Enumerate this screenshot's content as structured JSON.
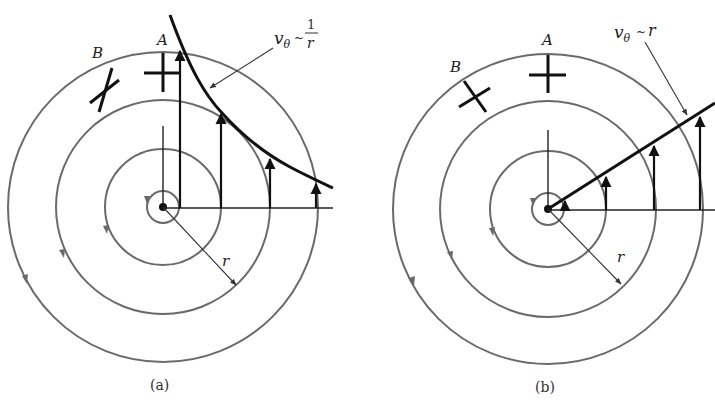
{
  "panels": [
    {
      "id": "a",
      "caption": "(a)",
      "velocity_law": {
        "main": "v",
        "sub": "θ",
        "tilde": "~",
        "num": "1",
        "den": "r"
      },
      "labels": {
        "A": "A",
        "B": "B",
        "radius": "r"
      },
      "description": "Irrotational (free) vortex: tangential velocity decreases as 1/r; fluid element B deforms but does not rotate"
    },
    {
      "id": "b",
      "caption": "(b)",
      "velocity_law": {
        "main": "v",
        "sub": "θ",
        "tilde": "~",
        "rhs": "r"
      },
      "labels": {
        "A": "A",
        "B": "B",
        "radius": "r"
      },
      "description": "Solid-body (forced) vortex: tangential velocity increases linearly with r; fluid element B rotates without deforming"
    }
  ],
  "colors": {
    "streamline": "#6a6a6a",
    "vector": "#111111"
  }
}
